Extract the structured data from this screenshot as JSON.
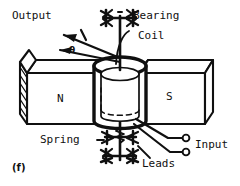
{
  "figure": {
    "caption": "(f)",
    "line_color": "#101010",
    "fill_color": "#ffffff",
    "background": "#ffffff"
  },
  "labels": {
    "output": "Output",
    "bearing": "Bearing",
    "coil": "Coil",
    "spring": "Spring",
    "leads": "Leads",
    "input": "Input",
    "theta": "θ",
    "pole_north": "N",
    "pole_south": "S"
  },
  "parts": [
    {
      "name": "output-arrow",
      "label": "Output"
    },
    {
      "name": "angle-theta",
      "label": "θ"
    },
    {
      "name": "upper-bearing",
      "label": "Bearing"
    },
    {
      "name": "coil-cylinder",
      "label": "Coil"
    },
    {
      "name": "magnet-north",
      "label": "N"
    },
    {
      "name": "magnet-south",
      "label": "S"
    },
    {
      "name": "lower-spring",
      "label": "Spring"
    },
    {
      "name": "lead-wires",
      "label": "Leads"
    },
    {
      "name": "input-terminals",
      "label": "Input"
    }
  ]
}
